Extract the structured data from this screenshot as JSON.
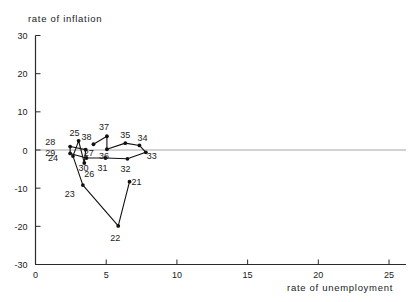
{
  "chart_data": {
    "type": "line",
    "title": "",
    "xlabel": "rate of unemployment",
    "ylabel": "rate of inflation",
    "xlim": [
      0,
      26.2
    ],
    "ylim": [
      -30,
      30
    ],
    "xticks": [
      0,
      5,
      10,
      15,
      20,
      25
    ],
    "xtick_labels": [
      "0",
      "5",
      "10",
      "15",
      "20",
      "25"
    ],
    "yticks": [
      -30,
      -20,
      -10,
      0,
      10,
      20,
      30
    ],
    "ytick_labels": [
      "-30",
      "-20",
      "-10",
      "0",
      "10",
      "20",
      "30"
    ],
    "grid": false,
    "legend": "none",
    "zero_line": true,
    "series": [
      {
        "name": "Phillips curve path 21-38",
        "connected": true,
        "points": [
          {
            "label": "21",
            "x": 6.65,
            "y": -8.3,
            "label_dx": 7,
            "label_dy": 3
          },
          {
            "label": "22",
            "x": 5.85,
            "y": -19.9,
            "label_dx": -3,
            "label_dy": 15
          },
          {
            "label": "23",
            "x": 3.35,
            "y": -9.2,
            "label_dx": -13,
            "label_dy": 12
          },
          {
            "label": "24",
            "x": 2.65,
            "y": -1.6,
            "label_dx": -20,
            "label_dy": 5
          },
          {
            "label": "25",
            "x": 3.05,
            "y": 2.4,
            "label_dx": -4,
            "label_dy": -5
          },
          {
            "label": "26",
            "x": 3.45,
            "y": -3.4,
            "label_dx": 5,
            "label_dy": 14
          },
          {
            "label": "27",
            "x": 3.55,
            "y": 0.1,
            "label_dx": 3,
            "label_dy": 6
          },
          {
            "label": "28",
            "x": 2.45,
            "y": 0.9,
            "label_dx": -20,
            "label_dy": -2
          },
          {
            "label": "29",
            "x": 2.45,
            "y": -0.9,
            "label_dx": -20,
            "label_dy": 3
          },
          {
            "label": "30",
            "x": 3.6,
            "y": -2.1,
            "label_dx": -3,
            "label_dy": 13
          },
          {
            "label": "31",
            "x": 4.95,
            "y": -2.1,
            "label_dx": -3,
            "label_dy": 13
          },
          {
            "label": "32",
            "x": 6.5,
            "y": -2.3,
            "label_dx": -2,
            "label_dy": 13
          },
          {
            "label": "33",
            "x": 7.8,
            "y": -0.6,
            "label_dx": 6,
            "label_dy": 7
          },
          {
            "label": "34",
            "x": 7.35,
            "y": 1.2,
            "label_dx": 3,
            "label_dy": -4
          },
          {
            "label": "35",
            "x": 6.35,
            "y": 1.8,
            "label_dx": 0,
            "label_dy": -5
          },
          {
            "label": "36",
            "x": 5.05,
            "y": 0.2,
            "label_dx": -3,
            "label_dy": 10
          },
          {
            "label": "37",
            "x": 5.05,
            "y": 3.6,
            "label_dx": -3,
            "label_dy": -6
          },
          {
            "label": "38",
            "x": 4.1,
            "y": 1.5,
            "label_dx": -7,
            "label_dy": -4
          }
        ]
      }
    ]
  }
}
